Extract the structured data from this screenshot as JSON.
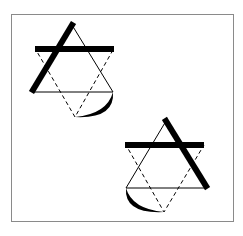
{
  "diagram": {
    "colors": {
      "background": "#ffffff",
      "frame": "#8a8a8a",
      "stroke": "#000000"
    },
    "frame": {
      "x": 11,
      "y": 14,
      "width": 222,
      "height": 207
    },
    "figures": [
      {
        "id": "figure-top-left",
        "upright_triangle": {
          "apex": [
            72,
            25
          ],
          "left": [
            33,
            92
          ],
          "right": [
            113,
            92
          ]
        },
        "inverted_triangle_dashed": {
          "left": [
            36,
            50
          ],
          "right": [
            113,
            50
          ],
          "bottom": [
            75,
            117
          ]
        },
        "horizontal_bar": {
          "x1": 35,
          "x2": 114,
          "y": 49,
          "thickness": 6
        },
        "thick_side": {
          "from": [
            72,
            25
          ],
          "to": [
            33,
            90
          ],
          "thickness": 6
        },
        "arc": {
          "from": [
            113,
            92
          ],
          "to": [
            75,
            117
          ],
          "side": "right"
        }
      },
      {
        "id": "figure-bottom-right",
        "upright_triangle": {
          "apex": [
            166,
            121
          ],
          "left": [
            126,
            188
          ],
          "right": [
            206,
            188
          ]
        },
        "inverted_triangle_dashed": {
          "left": [
            126,
            145
          ],
          "right": [
            204,
            145
          ],
          "bottom": [
            164,
            212
          ]
        },
        "horizontal_bar": {
          "x1": 125,
          "x2": 204,
          "y": 145,
          "thickness": 6
        },
        "thick_side": {
          "from": [
            166,
            121
          ],
          "to": [
            206,
            186
          ],
          "thickness": 6
        },
        "arc": {
          "from": [
            126,
            188
          ],
          "to": [
            164,
            212
          ],
          "side": "left"
        }
      }
    ]
  }
}
